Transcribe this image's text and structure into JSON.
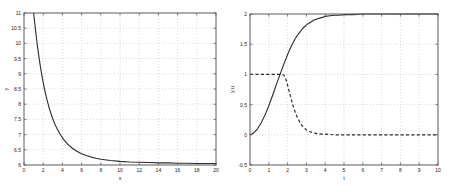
{
  "figure": {
    "background_color": "#ffffff",
    "axis_color": "#5a5a5a",
    "grid_color": "#bdbdbd",
    "curve_color": "#2a2a2a"
  },
  "chart_data": [
    {
      "type": "line",
      "panel": "left",
      "title": "",
      "xlabel": "x",
      "ylabel": "y",
      "xlim": [
        0,
        20
      ],
      "ylim": [
        6,
        11
      ],
      "grid": true,
      "legend": false,
      "xticks": [
        0,
        2,
        4,
        6,
        8,
        10,
        12,
        14,
        16,
        18,
        20
      ],
      "xticklabels": [
        "0",
        "2",
        "4",
        "6",
        "8",
        "10",
        "12",
        "14",
        "16",
        "18",
        "20"
      ],
      "yticks": [
        6,
        6.5,
        7,
        7.5,
        8,
        8.5,
        9,
        9.5,
        10,
        10.5,
        11
      ],
      "yticklabels": [
        "6",
        "6.5",
        "7",
        "7.5",
        "8",
        "8.5",
        "9",
        "9.5",
        "10",
        "10.5",
        "11"
      ],
      "series": [
        {
          "name": "y",
          "style": "solid",
          "x": [
            1.0,
            1.1,
            1.2,
            1.3,
            1.4,
            1.5,
            1.6,
            1.7,
            1.8,
            1.9,
            2.0,
            2.2,
            2.4,
            2.6,
            2.8,
            3.0,
            3.25,
            3.5,
            3.75,
            4.0,
            4.25,
            4.5,
            4.75,
            5.0,
            5.5,
            6.0,
            6.5,
            7.0,
            7.5,
            8.0,
            9.0,
            10.0,
            11.0,
            12.0,
            13.0,
            14.0,
            15.0,
            16.0,
            17.0,
            18.0,
            19.0,
            20.0
          ],
          "y": [
            11.0,
            10.72,
            10.44,
            10.17,
            9.92,
            9.68,
            9.46,
            9.25,
            9.06,
            8.88,
            8.71,
            8.4,
            8.14,
            7.9,
            7.7,
            7.52,
            7.32,
            7.16,
            7.02,
            6.9,
            6.79,
            6.7,
            6.63,
            6.56,
            6.45,
            6.37,
            6.31,
            6.26,
            6.22,
            6.19,
            6.15,
            6.12,
            6.1,
            6.09,
            6.08,
            6.07,
            6.07,
            6.06,
            6.06,
            6.05,
            6.05,
            6.05
          ]
        }
      ]
    },
    {
      "type": "line",
      "panel": "right",
      "title": "",
      "xlabel": "t",
      "ylabel": "y,u",
      "xlim": [
        0,
        10
      ],
      "ylim": [
        -0.5,
        2
      ],
      "grid": true,
      "legend": false,
      "xticks": [
        0,
        1,
        2,
        3,
        4,
        5,
        6,
        7,
        8,
        9,
        10
      ],
      "xticklabels": [
        "0",
        "1",
        "2",
        "3",
        "4",
        "5",
        "6",
        "7",
        "8",
        "9",
        "10"
      ],
      "yticks": [
        -0.5,
        0,
        0.5,
        1,
        1.5,
        2
      ],
      "yticklabels": [
        "-0.5",
        "0",
        "0.5",
        "1",
        "1.5",
        "2"
      ],
      "series": [
        {
          "name": "y",
          "style": "solid",
          "x": [
            0.0,
            0.2,
            0.4,
            0.6,
            0.8,
            1.0,
            1.2,
            1.4,
            1.6,
            1.8,
            2.0,
            2.2,
            2.4,
            2.6,
            2.8,
            3.0,
            3.2,
            3.4,
            3.6,
            3.8,
            4.0,
            4.25,
            4.5,
            4.75,
            5.0,
            5.5,
            6.0,
            6.5,
            7.0,
            7.5,
            8.0,
            8.5,
            9.0,
            9.5,
            10.0
          ],
          "y": [
            0.0,
            0.03,
            0.1,
            0.2,
            0.33,
            0.48,
            0.65,
            0.83,
            1.0,
            1.17,
            1.33,
            1.47,
            1.59,
            1.68,
            1.76,
            1.82,
            1.86,
            1.9,
            1.92,
            1.94,
            1.96,
            1.97,
            1.98,
            1.98,
            1.99,
            1.99,
            2.0,
            2.0,
            2.0,
            2.0,
            2.0,
            2.0,
            2.0,
            2.0,
            2.0
          ]
        },
        {
          "name": "u",
          "style": "dashed",
          "x": [
            0.0,
            0.4,
            0.8,
            1.2,
            1.5,
            1.7,
            1.8,
            1.9,
            2.0,
            2.1,
            2.2,
            2.3,
            2.4,
            2.5,
            2.6,
            2.7,
            2.8,
            2.9,
            3.0,
            3.2,
            3.4,
            3.6,
            3.8,
            4.0,
            4.5,
            5.0,
            5.5,
            6.0,
            6.5,
            7.0,
            7.5,
            8.0,
            8.5,
            9.0,
            9.5,
            10.0
          ],
          "y": [
            1.0,
            1.0,
            1.0,
            1.0,
            1.0,
            1.0,
            0.99,
            0.93,
            0.82,
            0.7,
            0.58,
            0.47,
            0.38,
            0.3,
            0.24,
            0.18,
            0.14,
            0.11,
            0.08,
            0.05,
            0.03,
            0.02,
            0.01,
            0.01,
            0.0,
            0.0,
            0.0,
            0.0,
            0.0,
            0.0,
            0.0,
            0.0,
            0.0,
            0.0,
            0.0,
            0.0
          ]
        }
      ]
    }
  ]
}
